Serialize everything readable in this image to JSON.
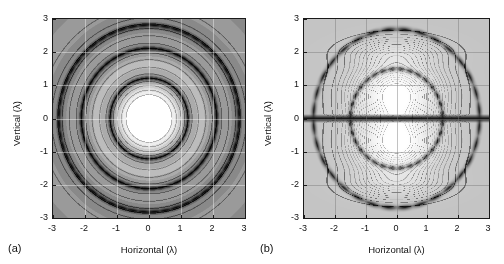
{
  "figure": {
    "background": "#ffffff",
    "width": 504,
    "height": 264
  },
  "panels": [
    {
      "id": "a",
      "caption": "(a)",
      "xlabel": "Horizontal (λ)",
      "ylabel": "Vertical (λ)",
      "xticks": [
        "-3",
        "-2",
        "-1",
        "0",
        "1",
        "2",
        "3"
      ],
      "yticks": [
        "3",
        "2",
        "1",
        "0",
        "-1",
        "-2",
        "-3"
      ]
    },
    {
      "id": "b",
      "caption": "(b)",
      "xlabel": "Horizontal (λ)",
      "ylabel": "Vertical (λ)",
      "xticks": [
        "-3",
        "-2",
        "-1",
        "0",
        "1",
        "2",
        "3"
      ],
      "yticks": [
        "3",
        "2",
        "1",
        "0",
        "-1",
        "-2",
        "-3"
      ]
    }
  ],
  "chart_data": [
    {
      "type": "heatmap",
      "panel": "a",
      "title": "",
      "xlabel": "Horizontal (λ)",
      "ylabel": "Vertical (λ)",
      "xlim": [
        -3,
        3
      ],
      "ylim": [
        -3,
        3
      ],
      "xticks": [
        -3,
        -2,
        -1,
        0,
        1,
        2,
        3
      ],
      "yticks": [
        -3,
        -2,
        -1,
        0,
        1,
        2,
        3
      ],
      "grid": true,
      "colormap": "grayscale",
      "symmetry": "circular",
      "description": "Filled grayscale contour map of a circularly symmetric field; bright white central disc with concentric rings growing darker outward, with narrow dark contour-dense rings at intermediate radii.",
      "radial_profile": {
        "r": [
          0.0,
          0.35,
          0.7,
          0.85,
          1.0,
          1.2,
          1.4,
          1.6,
          1.8,
          2.0,
          2.1,
          2.3,
          2.5,
          2.7,
          2.85,
          3.0,
          3.6,
          4.2
        ],
        "level": [
          1.0,
          0.99,
          0.96,
          0.84,
          0.7,
          0.3,
          0.55,
          0.62,
          0.58,
          0.38,
          0.22,
          0.45,
          0.5,
          0.3,
          0.24,
          0.4,
          0.42,
          0.4
        ]
      },
      "contour_rings_r": [
        0.72,
        0.86,
        1.0,
        1.12,
        1.22,
        1.35,
        1.55,
        1.78,
        1.98,
        2.12,
        2.28,
        2.5,
        2.72,
        2.86,
        3.05,
        3.4
      ],
      "dark_rings_r": [
        1.22,
        2.12,
        2.82
      ]
    },
    {
      "type": "heatmap",
      "panel": "b",
      "title": "",
      "xlabel": "Horizontal (λ)",
      "ylabel": "Vertical (λ)",
      "xlim": [
        -3,
        3
      ],
      "ylim": [
        -3,
        3
      ],
      "xticks": [
        -3,
        -2,
        -1,
        0,
        1,
        2,
        3
      ],
      "yticks": [
        -3,
        -2,
        -1,
        0,
        1,
        2,
        3
      ],
      "grid": true,
      "colormap": "grayscale",
      "symmetry": "two-lobed, mirror about Vertical=0",
      "description": "Light-background contour map with two bright elliptical lobes centred near Vertical = +0.8 and -0.8, separated by a strong horizontal dark null band along Vertical = 0 that extends across the full horizontal range. Beaded dark contour-dense arcs encircle the lobes near radius 1.5 and 2.7.",
      "null_line_y": 0.0,
      "lobe_centers": [
        [
          0.0,
          0.8
        ],
        [
          0.0,
          -0.8
        ]
      ],
      "lobe_peak_level": 1.0,
      "contour_arcs_r": [
        1.5,
        2.7
      ],
      "inner_contour_levels": [
        0.95,
        0.9,
        0.8,
        0.7,
        0.6,
        0.5,
        0.4,
        0.3,
        0.2
      ],
      "secondary_lobes_y": [
        2.0,
        -2.0
      ]
    }
  ]
}
